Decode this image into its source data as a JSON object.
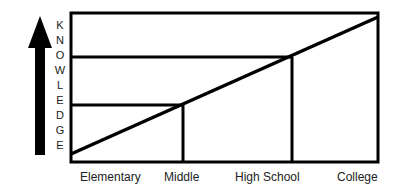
{
  "diagram": {
    "y_axis_label": "KNOWLEDGE",
    "y_axis_letters": [
      "K",
      "N",
      "O",
      "W",
      "L",
      "E",
      "D",
      "G",
      "E"
    ],
    "x_labels": [
      "Elementary",
      "Middle",
      "High School",
      "College"
    ],
    "arrow_icon": "up-arrow",
    "colors": {
      "line": "#000000",
      "background": "#ffffff"
    }
  }
}
